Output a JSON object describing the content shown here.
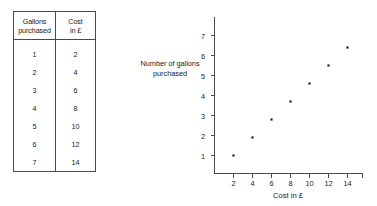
{
  "table": {
    "headers": [
      {
        "line1": "Gallons",
        "line2": "purchased"
      },
      {
        "line1": "Cost",
        "line2": "in £"
      }
    ],
    "rows": [
      {
        "gallons": "1",
        "cost": "2"
      },
      {
        "gallons": "2",
        "cost": "4"
      },
      {
        "gallons": "3",
        "cost": "6"
      },
      {
        "gallons": "4",
        "cost": "8"
      },
      {
        "gallons": "5",
        "cost": "10"
      },
      {
        "gallons": "6",
        "cost": "12"
      },
      {
        "gallons": "7",
        "cost": "14"
      }
    ]
  },
  "chart_labels": {
    "ylabel_line1": "Number of gallons",
    "ylabel_line2": "purchased",
    "xlabel": "Cost in £",
    "xticks": [
      "2",
      "4",
      "6",
      "8",
      "10",
      "12",
      "14"
    ],
    "yticks": [
      "1",
      "2",
      "3",
      "4",
      "5",
      "6",
      "7"
    ]
  },
  "chart_data": {
    "type": "scatter",
    "title": "",
    "xlabel": "Cost in £",
    "ylabel": "Number of gallons purchased",
    "xlim": [
      0,
      16
    ],
    "ylim": [
      0,
      8
    ],
    "xticks": [
      2,
      4,
      6,
      8,
      10,
      12,
      14
    ],
    "yticks": [
      1,
      2,
      3,
      4,
      5,
      6,
      7
    ],
    "grid": false,
    "legend": false,
    "marker_color": "#222222",
    "series": [
      {
        "name": "Gallons vs cost",
        "x": [
          2,
          4,
          6,
          8,
          10,
          12,
          14
        ],
        "y": [
          1,
          2,
          3,
          4,
          5,
          6,
          7
        ]
      }
    ]
  }
}
